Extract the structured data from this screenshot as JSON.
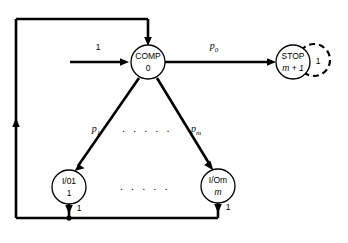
{
  "diagram": {
    "type": "state-transition-diagram",
    "title": "",
    "background_color": "#ffffff",
    "stroke_color": "#000000",
    "nodes": [
      {
        "id": "comp",
        "name": "comp-node",
        "line1": "COMP",
        "line2": "0",
        "cx": 148,
        "cy": 62,
        "r": 17,
        "shape": "circle",
        "style": "solid"
      },
      {
        "id": "stop",
        "name": "stop-node",
        "line1": "STOP",
        "line2": "m + 1",
        "cx": 293,
        "cy": 62,
        "r": 17,
        "shape": "circle",
        "style": "solid"
      },
      {
        "id": "io1",
        "name": "io-first-node",
        "line1": "I/01",
        "line2": "1",
        "cx": 69,
        "cy": 187,
        "r": 17,
        "shape": "circle",
        "style": "solid"
      },
      {
        "id": "iom",
        "name": "io-last-node",
        "line1": "I/Om",
        "line2": "m",
        "cx": 218,
        "cy": 186,
        "r": 17,
        "shape": "circle",
        "style": "solid"
      }
    ],
    "self_loop": {
      "name": "stop-self-loop",
      "cx": 314,
      "cy": 60,
      "r": 16,
      "label": "1",
      "label_x": 317,
      "label_y": 62,
      "style": "dashed"
    },
    "edge_labels": {
      "entry_weight": "1",
      "p_zero_base": "p",
      "p_zero_sub": "0",
      "p_one_base": "p",
      "p_one_sub": "1",
      "p_m_base": "p",
      "p_m_sub": "m",
      "io1_return_weight": "1",
      "iom_return_weight": "1"
    },
    "ellipsis": {
      "upper": ". . . . .",
      "lower": ". . . . ."
    }
  }
}
